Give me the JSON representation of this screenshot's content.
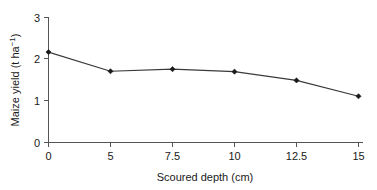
{
  "chart_data": {
    "type": "line",
    "title": "",
    "xlabel": "Scoured depth (cm)",
    "ylabel": "Maize yield (t ha−1)",
    "ylabel_parts": {
      "main": "Maize yield (t ha",
      "superscript": "−1",
      "tail": ")"
    },
    "categories": [
      "0",
      "5",
      "7.5",
      "10",
      "12.5",
      "15"
    ],
    "x": [
      0,
      5,
      7.5,
      10,
      12.5,
      15
    ],
    "values": [
      2.17,
      1.71,
      1.76,
      1.7,
      1.49,
      1.11
    ],
    "ylim": [
      0,
      3
    ],
    "ytick_labels": [
      "0",
      "1",
      "2",
      "3"
    ],
    "yticks": [
      0,
      1,
      2,
      3
    ],
    "xtick_labels": [
      "0",
      "5",
      "7.5",
      "10",
      "12.5",
      "15"
    ],
    "grid": false,
    "legend": false,
    "legend_position": "none",
    "marker": "diamond",
    "line_color": "#3a3a3a",
    "marker_color": "#1a1a1a",
    "axis_color": "#555555",
    "background_color": "#ffffff",
    "axis_spacing": "categorical"
  }
}
